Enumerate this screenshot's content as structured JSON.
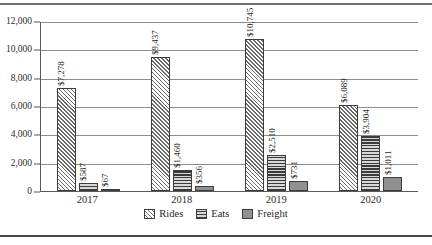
{
  "chart_data": {
    "type": "bar",
    "title": "",
    "xlabel": "",
    "ylabel": "",
    "categories": [
      "2017",
      "2018",
      "2019",
      "2020"
    ],
    "ylim": [
      0,
      12000
    ],
    "yticks": [
      "0",
      "2,000",
      "4,000",
      "6,000",
      "8,000",
      "10,000",
      "12,000"
    ],
    "ytick_values": [
      0,
      2000,
      4000,
      6000,
      8000,
      10000,
      12000
    ],
    "grid": true,
    "legend_position": "bottom",
    "series": [
      {
        "name": "Rides",
        "pattern": "diagonal-hatch",
        "values": [
          7278,
          9437,
          10745,
          6089
        ],
        "labels": [
          "$7,278",
          "$9,437",
          "$10,745",
          "$6,089"
        ]
      },
      {
        "name": "Eats",
        "pattern": "horizontal-stripes",
        "values": [
          587,
          1460,
          2510,
          3904
        ],
        "labels": [
          "$587",
          "$1,460",
          "$2,510",
          "$3,904"
        ]
      },
      {
        "name": "Freight",
        "pattern": "solid-gray",
        "values": [
          67,
          356,
          731,
          1011
        ],
        "labels": [
          "$67",
          "$356",
          "$731",
          "$1,011"
        ]
      }
    ]
  }
}
